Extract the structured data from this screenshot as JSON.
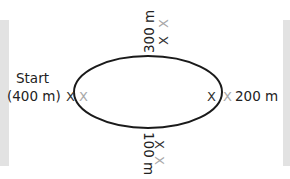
{
  "diagram": {
    "type": "oval-track",
    "start_label": "Start",
    "labels": {
      "start_distance": "(400 m)",
      "top": "300 m",
      "right": "200 m",
      "bottom": "100 m"
    },
    "markers": {
      "dark": "X",
      "light": "X"
    },
    "colors": {
      "track": "#1a1a1a",
      "text": "#222222",
      "marker_dark": "#333333",
      "marker_light": "#a8a8a8",
      "side_bars": "#e2e2e2"
    }
  }
}
